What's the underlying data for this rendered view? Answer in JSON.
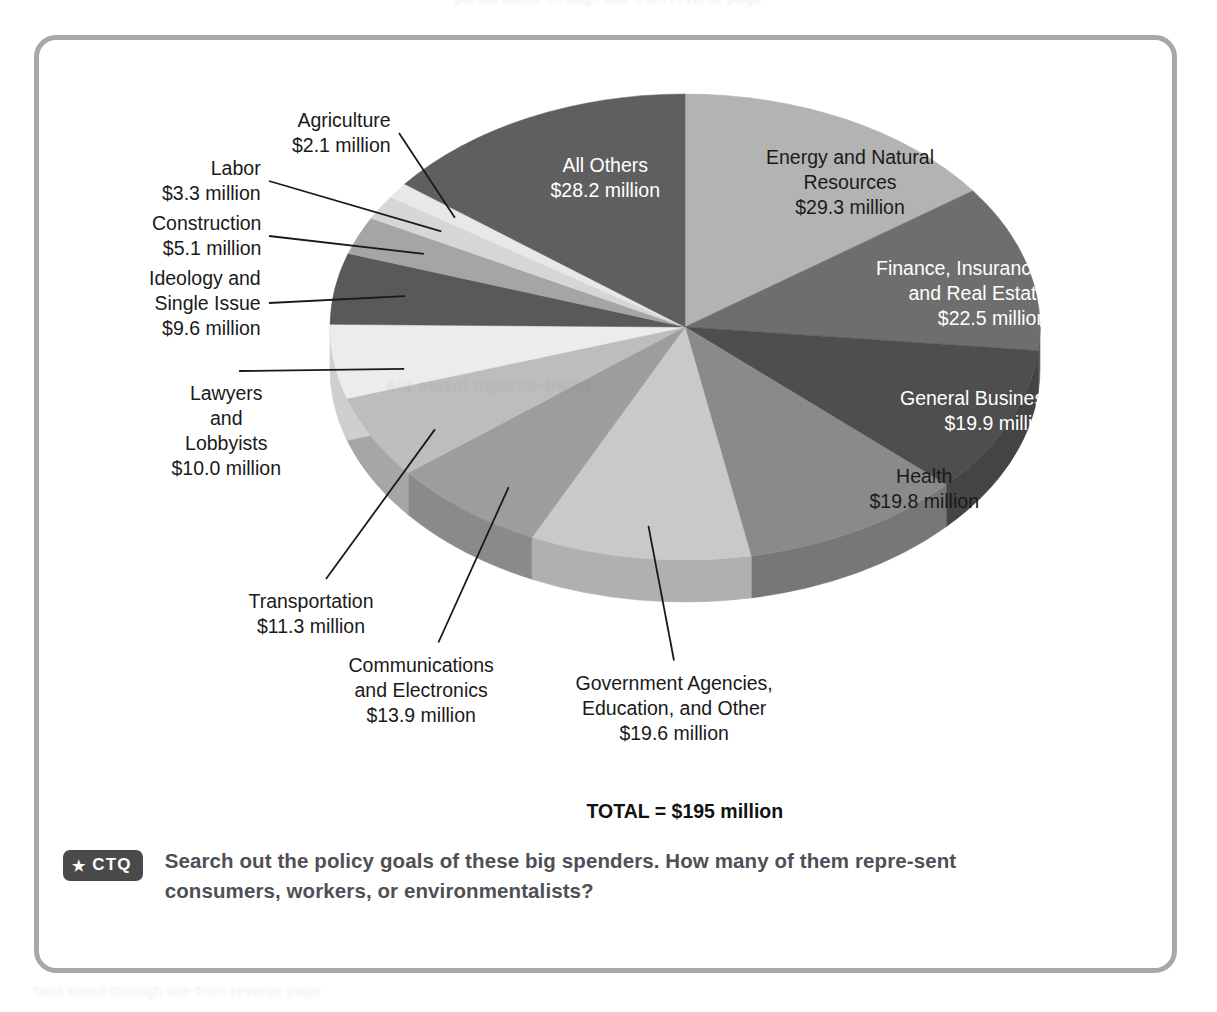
{
  "panel": {
    "border_color": "#a8a8a8"
  },
  "ghost_text": {
    "top": "partial bleed-through line from reverse page",
    "bottom": "faint bleed-through line from reverse page",
    "pie": "bleed-through inside pie"
  },
  "footer": {
    "badge_star": "★",
    "badge_label": "CTQ",
    "text": "Search out the policy goals of these big spenders. How many of them repre-sent consumers, workers, or environmentalists?"
  },
  "chart_data": {
    "type": "pie",
    "title": "",
    "subtitle": "",
    "unit": "million dollars",
    "total_label": "TOTAL = $195 million",
    "total_value": 195,
    "legend_position": "none",
    "grid": false,
    "three_d": true,
    "value_suffix": " million",
    "value_prefix": "$",
    "categories": [
      "Energy and Natural Resources",
      "Finance, Insurance, and Real Estate",
      "General Business",
      "Health",
      "Government Agencies, Education, and Other",
      "Communications and Electronics",
      "Transportation",
      "Lawyers and Lobbyists",
      "Ideology and Single Issue",
      "Construction",
      "Labor",
      "Agriculture",
      "All Others"
    ],
    "values": [
      29.3,
      22.5,
      19.9,
      19.8,
      19.6,
      13.9,
      11.3,
      10.0,
      9.6,
      5.1,
      3.3,
      2.1,
      28.2
    ],
    "slices": [
      {
        "name": "Energy and Natural Resources",
        "value": 29.3,
        "value_text": "$29.3 million",
        "label_lines": [
          "Energy and Natural",
          "Resources",
          "$29.3 million"
        ],
        "fill": "#b3b3b3",
        "side_fill": "#9a9a9a",
        "label_placement": "inside",
        "text_color": "dark",
        "label_x": 811,
        "label_y": 142,
        "align": "center"
      },
      {
        "name": "Finance, Insurance, and Real Estate",
        "value": 22.5,
        "value_text": "$22.5 million",
        "label_lines": [
          "Finance, Insurance,",
          "and Real Estate",
          "$22.5 million"
        ],
        "fill": "#6e6e6e",
        "side_fill": "#5e5e5e",
        "label_placement": "inside",
        "text_color": "light",
        "label_x": 1008,
        "label_y": 253,
        "align": "right"
      },
      {
        "name": "General Business",
        "value": 19.9,
        "value_text": "$19.9 million",
        "label_lines": [
          "General Business",
          "$19.9 million"
        ],
        "fill": "#4e4e4e",
        "side_fill": "#444444",
        "label_placement": "inside",
        "text_color": "light",
        "label_x": 1015,
        "label_y": 371,
        "align": "right"
      },
      {
        "name": "Health",
        "value": 19.8,
        "value_text": "$19.8 million",
        "label_lines": [
          "Health",
          "$19.8 million"
        ],
        "fill": "#8a8a8a",
        "side_fill": "#777777",
        "label_placement": "inside",
        "text_color": "dark",
        "label_x": 885,
        "label_y": 449,
        "align": "center"
      },
      {
        "name": "Government Agencies, Education, and Other",
        "value": 19.6,
        "value_text": "$19.6 million",
        "label_lines": [
          "Government Agencies,",
          "Education, and Other",
          "$19.6 million"
        ],
        "fill": "#c9c9c9",
        "side_fill": "#b0b0b0",
        "label_placement": "outside",
        "text_color": "dark",
        "label_x": 635,
        "label_y": 668,
        "align": "center"
      },
      {
        "name": "Communications and Electronics",
        "value": 13.9,
        "value_text": "$13.9 million",
        "label_lines": [
          "Communications",
          "and Electronics",
          "$13.9 million"
        ],
        "fill": "#9d9d9d",
        "side_fill": "#8a8a8a",
        "label_placement": "outside",
        "text_color": "dark",
        "label_x": 382,
        "label_y": 650,
        "align": "center"
      },
      {
        "name": "Transportation",
        "value": 11.3,
        "value_text": "$11.3 million",
        "label_lines": [
          "Transportation",
          "$11.3 million"
        ],
        "fill": "#bdbdbd",
        "side_fill": "#a6a6a6",
        "label_placement": "outside",
        "text_color": "dark",
        "label_x": 272,
        "label_y": 574,
        "align": "center"
      },
      {
        "name": "Lawyers and Lobbyists",
        "value": 10.0,
        "value_text": "$10.0 million",
        "label_lines": [
          "Lawyers",
          "and",
          "Lobbyists",
          "$10.0 million"
        ],
        "fill": "#ececec",
        "side_fill": "#cfcfcf",
        "label_placement": "outside",
        "text_color": "dark",
        "label_x": 187,
        "label_y": 391,
        "align": "center"
      },
      {
        "name": "Ideology and Single Issue",
        "value": 9.6,
        "value_text": "$9.6 million",
        "label_lines": [
          "Ideology and",
          "Single Issue",
          "$9.6 million"
        ],
        "fill": "#595959",
        "side_fill": "#4b4b4b",
        "label_placement": "outside",
        "text_color": "dark",
        "label_x": 222,
        "label_y": 263,
        "align": "right"
      },
      {
        "name": "Construction",
        "value": 5.1,
        "value_text": "$5.1 million",
        "label_lines": [
          "Construction",
          "$5.1 million"
        ],
        "fill": "#a5a5a5",
        "side_fill": "#929292",
        "label_placement": "outside",
        "text_color": "dark",
        "label_x": 222,
        "label_y": 196,
        "align": "right"
      },
      {
        "name": "Labor",
        "value": 3.3,
        "value_text": "$3.3 million",
        "label_lines": [
          "Labor",
          "$3.3 million"
        ],
        "fill": "#d6d6d6",
        "side_fill": "#bcbcbc",
        "label_placement": "outside",
        "text_color": "dark",
        "label_x": 222,
        "label_y": 141,
        "align": "right"
      },
      {
        "name": "Agriculture",
        "value": 2.1,
        "value_text": "$2.1 million",
        "label_lines": [
          "Agriculture",
          "$2.1 million"
        ],
        "fill": "#e8e8e8",
        "side_fill": "#cccccc",
        "label_placement": "outside",
        "text_color": "dark",
        "label_x": 352,
        "label_y": 93,
        "align": "right"
      },
      {
        "name": "All Others",
        "value": 28.2,
        "value_text": "$28.2 million",
        "label_lines": [
          "All Others",
          "$28.2 million"
        ],
        "fill": "#5f5f5f",
        "side_fill": "#525252",
        "label_placement": "inside",
        "text_color": "light",
        "label_x": 566,
        "label_y": 138,
        "align": "center"
      }
    ]
  }
}
